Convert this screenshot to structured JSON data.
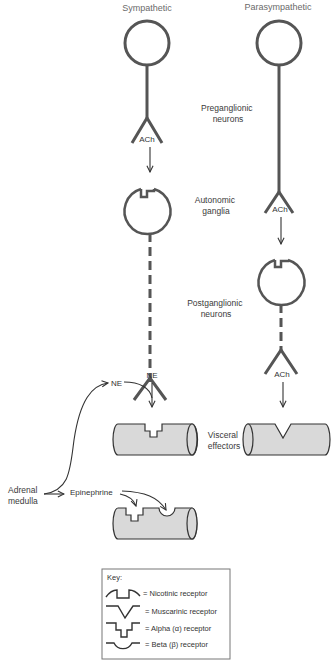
{
  "columns": {
    "sympathetic": "Sympathetic",
    "parasympathetic": "Parasympathetic"
  },
  "stage_labels": {
    "preganglionic": [
      "Preganglionic",
      "neurons"
    ],
    "ganglia": [
      "Autonomic",
      "ganglia"
    ],
    "postganglionic": [
      "Postganglionic",
      "neurons"
    ],
    "effectors": [
      "Visceral",
      "effectors"
    ]
  },
  "neurotransmitters": {
    "symp_pre": "ACh",
    "para_pre": "ACh",
    "symp_post": "NE",
    "para_post": "ACh",
    "adrenal_ne": "NE",
    "epinephrine": "Epinephrine"
  },
  "adrenal": [
    "Adrenal",
    "medulla"
  ],
  "key": {
    "title": "Key:",
    "items": [
      {
        "icon": "nicotinic-receptor",
        "label": "= Nicotinic receptor"
      },
      {
        "icon": "muscarinic-receptor",
        "label": "= Muscarinic receptor"
      },
      {
        "icon": "alpha-receptor",
        "label": "= Alpha (α) receptor"
      },
      {
        "icon": "beta-receptor",
        "label": "= Beta (β) receptor"
      }
    ]
  },
  "colors": {
    "stroke": "#555555",
    "effector_fill": "#d9d9d9",
    "text": "#3a3a3a"
  }
}
